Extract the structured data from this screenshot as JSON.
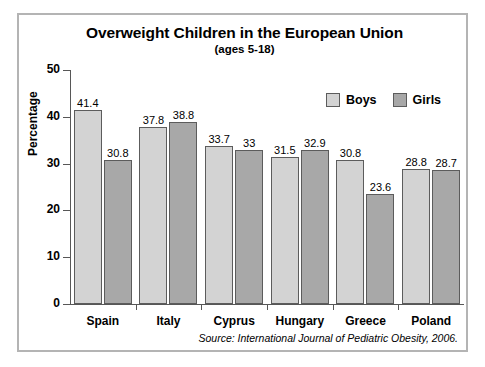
{
  "chart_data": {
    "type": "bar",
    "title": "Overweight Children in the European Union",
    "subtitle": "(ages 5-18)",
    "xlabel": "",
    "ylabel": "Percentage",
    "ylim": [
      0,
      50
    ],
    "yticks": [
      0,
      10,
      20,
      30,
      40,
      50
    ],
    "ytick_labels": [
      "0",
      "10",
      "20",
      "30",
      "40",
      "50"
    ],
    "grid": false,
    "legend_position": "upper right",
    "categories": [
      "Spain",
      "Italy",
      "Cyprus",
      "Hungary",
      "Greece",
      "Poland"
    ],
    "series": [
      {
        "name": "Boys",
        "color": "#d3d3d3",
        "values": [
          41.4,
          37.8,
          33.7,
          31.5,
          30.8,
          28.8
        ],
        "labels": [
          "41.4",
          "37.8",
          "33.7",
          "31.5",
          "30.8",
          "28.8"
        ]
      },
      {
        "name": "Girls",
        "color": "#a8a8a8",
        "values": [
          30.8,
          38.8,
          33,
          32.9,
          23.6,
          28.7
        ],
        "labels": [
          "30.8",
          "38.8",
          "33",
          "32.9",
          "23.6",
          "28.7"
        ]
      }
    ],
    "annotations": {
      "source": "Source: International Journal of Pediatric Obesity, 2006."
    }
  }
}
